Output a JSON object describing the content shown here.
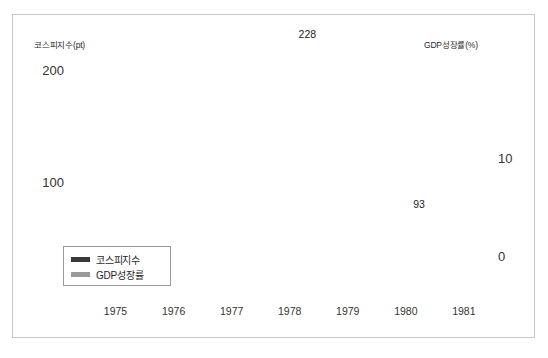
{
  "chart_data": {
    "type": "line",
    "title": "",
    "subtitle": "",
    "xlabel": "",
    "ylabel": "코스피지수(pt)",
    "y2label": "GDP성장률(%)",
    "grid": true,
    "legend_position": "bottom-left",
    "x_tick_labels": [
      "1975",
      "1976",
      "1977",
      "1978",
      "1979",
      "1980",
      "1981"
    ],
    "xlim": [
      1974.5,
      1981.7
    ],
    "axes": {
      "left": {
        "label": "코스피지수(pt)",
        "unit": "pt",
        "tick_labels": [
          "200",
          "100"
        ],
        "tick_values": [
          200,
          100
        ],
        "ylim": [
          0,
          250
        ]
      },
      "right": {
        "label": "GDP성장률(%)",
        "unit": "%",
        "tick_labels": [
          "10",
          "0"
        ],
        "tick_values": [
          10,
          0
        ],
        "ylim": [
          -5,
          22
        ]
      }
    },
    "annotations": [
      {
        "text": "228",
        "series": "코스피지수",
        "x": 1978.3,
        "value": 228
      },
      {
        "text": "93",
        "series": "코스피지수",
        "x": 1980.55,
        "value": 93
      }
    ],
    "series": [
      {
        "name": "코스피지수",
        "axis": "left",
        "color": "#383838",
        "x": [
          1974.6,
          1974.9,
          1975.2,
          1975.5,
          1975.75,
          1975.95,
          1976.1,
          1976.3,
          1976.55,
          1976.8,
          1977.05,
          1977.35,
          1977.7,
          1978.0,
          1978.3,
          1978.6,
          1978.9,
          1979.2,
          1979.5,
          1979.8,
          1980.1,
          1980.35,
          1980.55,
          1980.75,
          1981.0,
          1981.2,
          1981.4,
          1981.65
        ],
        "values": [
          100,
          101,
          104,
          110,
          127,
          145,
          148,
          158,
          170,
          172,
          172,
          176,
          186,
          206,
          228,
          205,
          172,
          158,
          153,
          148,
          140,
          112,
          93,
          118,
          170,
          197,
          213,
          176
        ]
      },
      {
        "name": "GDP성장률",
        "axis": "right",
        "color": "#9a9a9a",
        "x": [
          1974.6,
          1974.9,
          1975.2,
          1975.5,
          1975.8,
          1976.05,
          1976.3,
          1976.6,
          1976.9,
          1977.2,
          1977.5,
          1977.8,
          1978.1,
          1978.4,
          1978.7,
          1979.0,
          1979.3,
          1979.6,
          1979.9,
          1980.2,
          1980.5,
          1980.8,
          1981.1,
          1981.4,
          1981.65
        ],
        "values": [
          11.2,
          11.7,
          12.6,
          14.7,
          17.4,
          18.2,
          17.4,
          15.6,
          13.4,
          11.6,
          11.1,
          11.5,
          11.7,
          11.3,
          10.2,
          8.6,
          7.0,
          5.4,
          3.2,
          0.2,
          -1.7,
          -2.0,
          -0.1,
          3.2,
          4.3
        ]
      }
    ]
  },
  "legend": {
    "items": [
      {
        "label": "코스피지수",
        "color": "#383838"
      },
      {
        "label": "GDP성장률",
        "color": "#9a9a9a"
      }
    ]
  }
}
